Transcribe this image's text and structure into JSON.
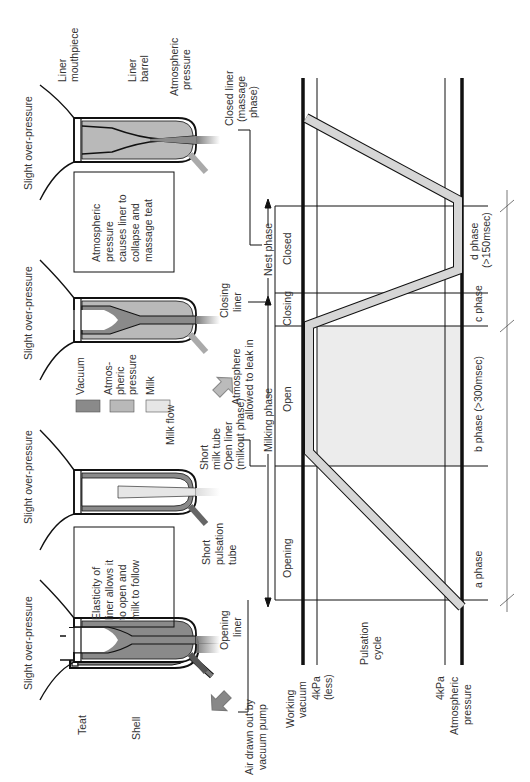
{
  "colors": {
    "vacuum": "#8a8a8a",
    "atmospheric": "#b9b9b9",
    "milk": "#e6e6e6",
    "open_fill": "#ececec",
    "line": "#111111",
    "text": "#333333"
  },
  "cups": [
    {
      "over_pressure": "Slight over-pressure",
      "state_label": [
        "Opening",
        "liner"
      ]
    },
    {
      "over_pressure": "Slight over-pressure",
      "state_label": [
        "Open liner",
        "(milkout phase)"
      ]
    },
    {
      "over_pressure": "Slight over-pressure",
      "state_label": [
        "Closing",
        "liner"
      ]
    },
    {
      "over_pressure": "Slight over-pressure",
      "state_label": [
        "Closed liner",
        "(massage",
        "phase)"
      ]
    }
  ],
  "part_labels": {
    "teat": "Teat",
    "shell": "Shell",
    "liner_mouthpiece": [
      "Liner",
      "mouthpiece"
    ],
    "liner_barrel": [
      "Liner",
      "barrel"
    ],
    "atmospheric_pressure": [
      "Atmospheric",
      "pressure"
    ],
    "short_milk_tube": [
      "Short",
      "milk tube"
    ],
    "short_pulsation_tube": [
      "Short",
      "pulsation",
      "tube"
    ],
    "milk_flow": "Milk flow"
  },
  "notes": {
    "air_drawn": [
      "Air drawn out by",
      "vacuum pump"
    ],
    "atmosphere_leak": [
      "Atmosphere",
      "allowed to leak in"
    ],
    "elasticity_box": [
      "Elasticity of",
      "liner allows it",
      "to open and",
      "milk to follow"
    ],
    "atmospheric_box": [
      "Atmospheric",
      "pressure",
      "causes liner to",
      "collapse and",
      "massage teat"
    ]
  },
  "legend": [
    {
      "label": [
        "Vacuum"
      ],
      "swatch": "vacuum"
    },
    {
      "label": [
        "Atmos-",
        "pheric",
        "pressure"
      ],
      "swatch": "atmospheric"
    },
    {
      "label": [
        "Milk"
      ],
      "swatch": "milk"
    }
  ],
  "chart": {
    "pulsation_cycle": [
      "Pulsation",
      "cycle"
    ],
    "axis_labels": {
      "working_vacuum": [
        "Working",
        "vacuum"
      ],
      "kpa_less": [
        "4kPa",
        "(less)"
      ],
      "kpa": "4kPa",
      "atmospheric": [
        "Atmospheric",
        "pressure"
      ]
    },
    "liner_states": [
      "Opening",
      "Open",
      "Closing",
      "Closed"
    ],
    "phase_groups": [
      "Milking phase",
      "Nest phase"
    ],
    "phases": [
      "a phase",
      "b phase (>300msec)",
      "c phase",
      [
        "d phase",
        "(>150msec)"
      ]
    ]
  }
}
